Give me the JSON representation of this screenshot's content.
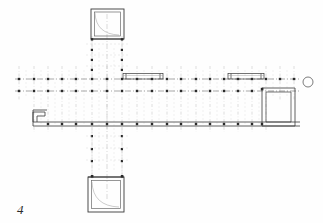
{
  "drawing": {
    "title": "Architectural floor plan — cruciform basilica / hall plan",
    "figure_label": "4",
    "paper_color": "#fefefe",
    "line_color": "#3a3a3a",
    "grid_line_color": "#9a9a9a",
    "column_color": "#2a2a2a",
    "faint_color": "#c9c9c9"
  },
  "scale_note": "",
  "elements": {
    "north_pavilion": {
      "name": "north-pavilion",
      "label": "",
      "x": 91,
      "y": 9,
      "width": 32,
      "height": 30,
      "wall_thickness": 3
    },
    "south_pavilion": {
      "name": "south-pavilion",
      "label": "",
      "x": 88,
      "y": 177,
      "width": 36,
      "height": 35,
      "wall_thickness": 3
    },
    "east_room": {
      "name": "east-room",
      "label": "",
      "x": 262,
      "y": 88,
      "width": 33,
      "height": 38,
      "wall_thickness": 2
    },
    "west_step": {
      "name": "west-step-notch",
      "label": "",
      "x": 33,
      "y": 111,
      "width": 12,
      "height": 12
    },
    "circle_marker": {
      "name": "east-circle-marker",
      "label": "",
      "cx": 308,
      "cy": 82,
      "r": 5
    },
    "porch_west": {
      "name": "north-porch-west",
      "label": "",
      "x": 123,
      "y": 73,
      "width": 40,
      "height": 7
    },
    "porch_east": {
      "name": "north-porch-east",
      "label": "",
      "x": 228,
      "y": 73,
      "width": 36,
      "height": 7
    }
  },
  "axes": {
    "horizontal": [
      {
        "id": "A",
        "y": 79,
        "x1": 15,
        "x2": 300,
        "style": "dash-dot"
      },
      {
        "id": "B",
        "y": 91,
        "x1": 15,
        "x2": 300,
        "style": "dash-dot"
      },
      {
        "id": "C",
        "y": 124,
        "x1": 33,
        "x2": 300,
        "style": "solid-wall"
      }
    ],
    "vertical_x_positions": [
      19,
      34,
      48,
      62,
      76,
      92,
      107,
      122,
      137,
      152,
      167,
      181,
      196,
      210,
      224,
      238,
      252,
      266,
      280,
      294
    ],
    "vertical_span_top": 66,
    "vertical_span_bottom": 132,
    "cross_arm_x": [
      92,
      122
    ],
    "cross_arm_top": 36,
    "cross_arm_bottom": 180
  },
  "columns": {
    "note": "Grid intersection column dots",
    "row_y": [
      79,
      91,
      124
    ],
    "arm_row_y": [
      44,
      55,
      66,
      136,
      148,
      160,
      172
    ]
  },
  "legend": {
    "figure_number": "4"
  }
}
